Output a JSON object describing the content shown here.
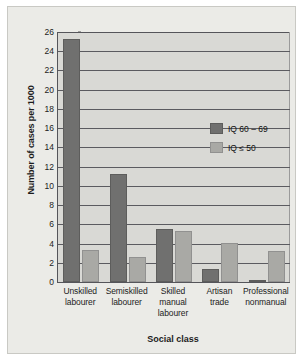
{
  "chart_data": {
    "type": "bar",
    "title": "",
    "subtitle": "",
    "xlabel": "Social class",
    "ylabel": "Number of cases per 1000",
    "categories": [
      [
        "Unskilled",
        "labourer"
      ],
      [
        "Semiskilled",
        "labourer"
      ],
      [
        "Skilled",
        "manual",
        "labourer"
      ],
      [
        "Artisan",
        "trade"
      ],
      [
        "Professional",
        "nonmanual"
      ]
    ],
    "category_labels": [
      "Unskilled labourer",
      "Semiskilled labourer",
      "Skilled manual labourer",
      "Artisan trade",
      "Professional nonmanual"
    ],
    "series": [
      {
        "name": "IQ 60 – 69",
        "color": "#70706f",
        "values": [
          25.3,
          11.2,
          5.5,
          1.4,
          0.1
        ]
      },
      {
        "name": "IQ ≤ 50",
        "color": "#a9a9a5",
        "values": [
          3.3,
          2.6,
          5.3,
          4.1,
          3.2
        ]
      }
    ],
    "ylim": [
      0,
      26
    ],
    "ytick_step": 2,
    "yticks": [
      0,
      2,
      4,
      6,
      8,
      10,
      12,
      14,
      16,
      18,
      20,
      22,
      24,
      26
    ],
    "ytick_labels": [
      "0",
      "2",
      "4",
      "6",
      "8",
      "10",
      "12",
      "14",
      "16",
      "18",
      "20",
      "22",
      "24",
      "26"
    ],
    "grid": true,
    "grid_axis": "y",
    "legend_position": "inside-upper-right",
    "plot_background": "#d9d9d5",
    "figure_background": "#ebebe7",
    "axis_color": "#55555a"
  },
  "legend": {
    "entries": [
      {
        "label": "IQ 60 – 69"
      },
      {
        "label": "IQ ≤ 50"
      }
    ]
  }
}
